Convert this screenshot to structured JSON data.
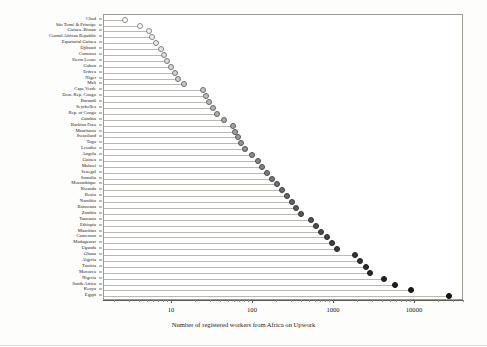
{
  "chart_data": {
    "type": "scatter",
    "subtype": "lollipop-dot-plot",
    "title": "",
    "xlabel": "Number of registered workers from Africa on Upwork",
    "ylabel": "",
    "xscale": "log",
    "xlim": [
      1.7,
      40000
    ],
    "xticks": [
      10,
      100,
      1000,
      10000
    ],
    "xticklabels": [
      "10",
      "100",
      "1000",
      "10000"
    ],
    "grid": false,
    "legend": null,
    "orientation": "horizontal",
    "sorted": "ascending by value (top to bottom)",
    "marker_colorscale": "light grey (low) to near-black (high)",
    "categories": [
      "Chad",
      "São Tomé & Príncipe",
      "Guinea–Bissau",
      "Central African Republic",
      "Equatorial Guinea",
      "Djibouti",
      "Comoros",
      "Sierra Leone",
      "Gabon",
      "Eritrea",
      "Niger",
      "Mali",
      "Cape Verde",
      "Dem. Rep. Congo",
      "Burundi",
      "Seychelles",
      "Rep. of Congo",
      "Gambia",
      "Burkina Faso",
      "Mauritania",
      "Swaziland",
      "Togo",
      "Lesotho",
      "Angola",
      "Guinea",
      "Malawi",
      "Senegal",
      "Somalia",
      "Mozambique",
      "Rwanda",
      "Benin",
      "Namibia",
      "Botswana",
      "Zambia",
      "Tanzania",
      "Ethiopia",
      "Mauritius",
      "Cameroon",
      "Madagascar",
      "Uganda",
      "Ghana",
      "Algeria",
      "Tunisia",
      "Morocco",
      "Nigeria",
      "South Africa",
      "Kenya",
      "Egypt"
    ],
    "values": [
      2.6,
      4.0,
      5.2,
      5.6,
      6.4,
      7.4,
      8.0,
      8.6,
      9.6,
      11,
      12,
      14,
      24,
      26,
      29,
      32,
      36,
      44,
      56,
      60,
      66,
      72,
      80,
      96,
      115,
      130,
      150,
      170,
      200,
      230,
      260,
      300,
      340,
      390,
      520,
      600,
      700,
      820,
      950,
      1100,
      1800,
      2100,
      2500,
      2800,
      4200,
      5600,
      9000,
      26000
    ]
  },
  "axis": {
    "x_title": "Number of registered workers from Africa on Upwork"
  }
}
